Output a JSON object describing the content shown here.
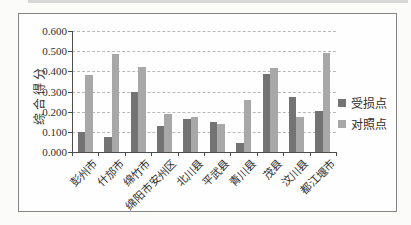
{
  "chart_data": {
    "type": "bar",
    "title": "",
    "ylabel": "综合得分",
    "xlabel": "",
    "ylim": [
      0,
      0.6
    ],
    "ytick_interval": 0.1,
    "ytick_labels": [
      "0.600",
      "0.500",
      "0.400",
      "0.300",
      "0.200",
      "0.100",
      "0.000"
    ],
    "grid": "horizontal-dashed",
    "legend_position": "right",
    "categories": [
      "彭州市",
      "什邡市",
      "绵竹市",
      "绵阳市安州区",
      "北川县",
      "平武县",
      "青川县",
      "茂县",
      "汶川县",
      "都江堰市"
    ],
    "series": [
      {
        "name": "受损点",
        "color": "#737373",
        "values": [
          0.1,
          0.075,
          0.3,
          0.128,
          0.162,
          0.15,
          0.045,
          0.386,
          0.272,
          0.202
        ]
      },
      {
        "name": "对照点",
        "color": "#a8a8a8",
        "values": [
          0.38,
          0.485,
          0.42,
          0.19,
          0.172,
          0.14,
          0.26,
          0.415,
          0.175,
          0.49
        ]
      }
    ]
  }
}
